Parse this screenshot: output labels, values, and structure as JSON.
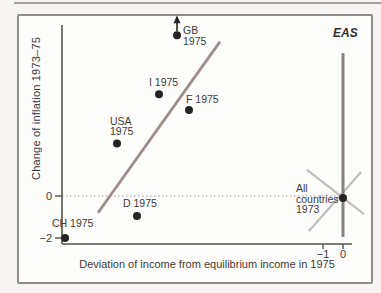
{
  "chart_data": {
    "type": "scatter",
    "title": "",
    "xlabel": "Deviation of income from equilibrium income in 1975",
    "ylabel": "Change of inflation 1973–75",
    "eas_label": "EAS",
    "x_ticks": [
      {
        "value": -1,
        "label": "−1"
      },
      {
        "value": 0,
        "label": "0"
      }
    ],
    "y_ticks": [
      {
        "value": 0,
        "label": "0"
      },
      {
        "value": -2,
        "label": "−2"
      }
    ],
    "xlim": [
      -14.6,
      1.6
    ],
    "ylim": [
      -2.3,
      8.2
    ],
    "zero_line_y": 0,
    "grid": "dotted-zero-line-only",
    "legend": "none",
    "points": [
      {
        "id": "ch",
        "label": "CH 1975",
        "x": -13.9,
        "y": -2.0
      },
      {
        "id": "usa",
        "label": "USA\n1975",
        "x": -11.3,
        "y": 2.5
      },
      {
        "id": "d",
        "label": "D 1975",
        "x": -10.3,
        "y": -0.95
      },
      {
        "id": "i",
        "label": "I 1975",
        "x": -9.2,
        "y": 4.85
      },
      {
        "id": "gb",
        "label": "GB\n1975",
        "x": -8.3,
        "y": 7.65,
        "arrow_up": true
      },
      {
        "id": "f",
        "label": "F 1975",
        "x": -7.7,
        "y": 4.1
      },
      {
        "id": "all",
        "label": "All\ncountries\n1973",
        "x": 0.0,
        "y": -0.1
      }
    ],
    "lines": [
      {
        "id": "as-fit-line",
        "x1": -12.25,
        "y1": -0.8,
        "x2": -6.15,
        "y2": 7.35,
        "color_key": "accent",
        "width": 2.8
      },
      {
        "id": "eas-line",
        "x1": 0.0,
        "y1": -1.95,
        "x2": 0.0,
        "y2": 6.8,
        "color_key": "accent_dark",
        "width": 3
      },
      {
        "id": "cross-line-1",
        "x1": -1.8,
        "y1": 1.24,
        "x2": 1.05,
        "y2": -0.86,
        "color_key": "gray_light",
        "width": 2.2
      },
      {
        "id": "cross-line-2",
        "x1": -1.7,
        "y1": -1.67,
        "x2": 0.9,
        "y2": 1.14,
        "color_key": "gray_light",
        "width": 2.2
      }
    ]
  },
  "colors": {
    "accent": "#9e8d89",
    "accent_dark": "#878180",
    "gray_light": "#c3bdb9",
    "dot": "#262422",
    "axis": "#55534f",
    "dotted": "#9a9896",
    "text": "#3d3b39",
    "frame_border": "#8f8d8b"
  }
}
